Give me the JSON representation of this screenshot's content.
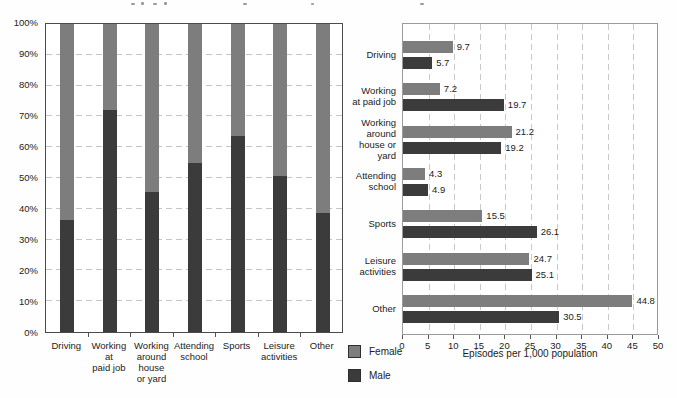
{
  "legend": {
    "items": [
      {
        "label": "Female",
        "color": "#7d7d7d"
      },
      {
        "label": "Male",
        "color": "#3b3b3b"
      }
    ]
  },
  "chart_data": [
    {
      "type": "bar",
      "variant": "100pct-stacked-vertical",
      "title": "",
      "categories": [
        "Driving",
        "Working at paid job",
        "Working around house or yard",
        "Attending school",
        "Sports",
        "Leisure activities",
        "Other"
      ],
      "categories_display": [
        "Driving",
        "Working\nat\npaid job",
        "Working\naround\nhouse\nor yard",
        "Attending\nschool",
        "Sports",
        "Leisure\nactivities",
        "Other"
      ],
      "series": [
        {
          "name": "Male",
          "color": "#3b3b3b",
          "values_pct": [
            36.5,
            72,
            45.5,
            55,
            63.5,
            50.5,
            38.5
          ]
        },
        {
          "name": "Female",
          "color": "#7d7d7d",
          "values_pct": [
            63.5,
            28,
            54.5,
            45,
            36.5,
            49.5,
            61.5
          ]
        }
      ],
      "ylim": [
        0,
        100
      ],
      "ytick_labels": [
        "0%",
        "10%",
        "20%",
        "30%",
        "40%",
        "50%",
        "60%",
        "70%",
        "80%",
        "90%",
        "100%"
      ],
      "grid": "dashed-horizontal",
      "legend_position": "none"
    },
    {
      "type": "bar",
      "variant": "grouped-horizontal",
      "title": "",
      "categories": [
        "Driving",
        "Working at paid job",
        "Working around house or yard",
        "Attending school",
        "Sports",
        "Leisure activities",
        "Other"
      ],
      "categories_display": [
        "Driving",
        "Working\nat paid job",
        "Working\naround\nhouse or\nyard",
        "Attending\nschool",
        "Sports",
        "Leisure\nactivities",
        "Other"
      ],
      "series": [
        {
          "name": "Female",
          "color": "#7d7d7d",
          "values": [
            9.7,
            7.2,
            21.2,
            4.3,
            15.5,
            24.7,
            44.8
          ]
        },
        {
          "name": "Male",
          "color": "#3b3b3b",
          "values": [
            5.7,
            19.7,
            19.2,
            4.9,
            26.1,
            25.1,
            30.5
          ]
        }
      ],
      "value_labels": [
        "9.7",
        "5.7",
        "7.2",
        "19.7",
        "21.2",
        "19.2",
        "4.3",
        "4.9",
        "15.5",
        "26.1",
        "24.7",
        "25.1",
        "44.8",
        "30.5"
      ],
      "xlabel": "Episodes per 1,000 population",
      "xlim": [
        0,
        50
      ],
      "xtick_labels": [
        "0",
        "5",
        "10",
        "15",
        "20",
        "25",
        "30",
        "35",
        "40",
        "45",
        "50"
      ],
      "grid": "dashed-vertical",
      "legend_position": "bottom-left"
    }
  ]
}
